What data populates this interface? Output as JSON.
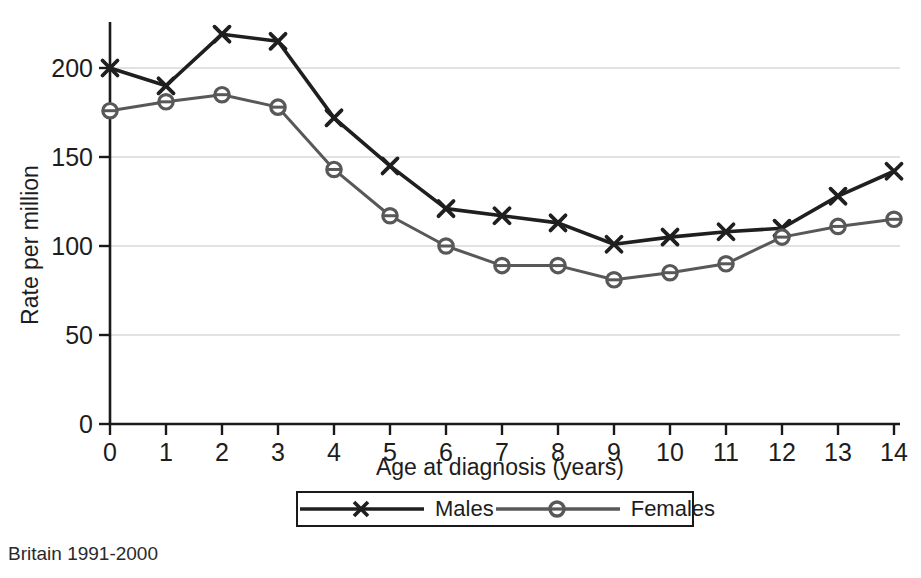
{
  "caption": "Britain 1991-2000",
  "legend": {
    "position": "bottom-center",
    "entries": [
      {
        "label": "Males",
        "marker": "x-marker-icon",
        "color": "#1f1f1f"
      },
      {
        "label": "Females",
        "marker": "circle-marker-icon",
        "color": "#585858"
      }
    ]
  },
  "chart_data": {
    "type": "line",
    "title": "",
    "subtitle": "",
    "xlabel": "Age at diagnosis (years)",
    "ylabel": "Rate per million",
    "x": [
      0,
      1,
      2,
      3,
      4,
      5,
      6,
      7,
      8,
      9,
      10,
      11,
      12,
      13,
      14
    ],
    "xticklabels": [
      "0",
      "1",
      "2",
      "3",
      "4",
      "5",
      "6",
      "7",
      "8",
      "9",
      "10",
      "11",
      "12",
      "13",
      "14"
    ],
    "xlim": [
      0,
      14
    ],
    "ylim": [
      0,
      230
    ],
    "yticks": [
      0,
      50,
      100,
      150,
      200
    ],
    "yticklabels": [
      "0",
      "50",
      "100",
      "150",
      "200"
    ],
    "grid": "horizontal",
    "grid_color": "#d8d8d8",
    "series": [
      {
        "name": "Males",
        "color": "#1f1f1f",
        "marker": "x",
        "values": [
          200,
          190,
          219,
          215,
          172,
          145,
          121,
          117,
          113,
          101,
          105,
          108,
          110,
          128,
          142
        ]
      },
      {
        "name": "Females",
        "color": "#585858",
        "marker": "o",
        "values": [
          176,
          181,
          185,
          178,
          143,
          117,
          100,
          89,
          89,
          81,
          85,
          90,
          105,
          111,
          115
        ]
      }
    ]
  }
}
